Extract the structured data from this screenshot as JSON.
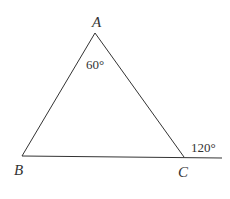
{
  "diagram": {
    "type": "triangle-exterior-angle",
    "vertices": [
      {
        "name": "A",
        "x": 95,
        "y": 33
      },
      {
        "name": "B",
        "x": 22,
        "y": 156
      },
      {
        "name": "C",
        "x": 184,
        "y": 157
      }
    ],
    "extension_end": {
      "x": 222,
      "y": 158
    },
    "labels": {
      "A": "A",
      "B": "B",
      "C": "C",
      "angle_A": "60°",
      "exterior_angle_C": "120°"
    },
    "line_color": "#333333"
  }
}
